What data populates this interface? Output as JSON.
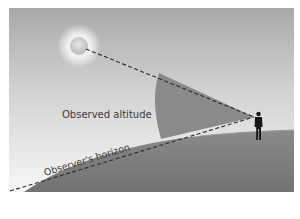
{
  "diagram": {
    "labels": {
      "observed_altitude": "Observed altitude",
      "observers_horizon": "Observer's horizon"
    },
    "elements": {
      "sun": "sun-icon",
      "observer": "person-silhouette-icon",
      "earth": "earth-surface",
      "sightline": "dashed line from observer to sun",
      "horizon_line": "dashed line tangent to observer's horizon",
      "angle": "shaded wedge between horizon and sightline"
    },
    "colors": {
      "sky_top": "#a9a9a9",
      "sky_bottom": "#f6f6f6",
      "earth": "#7c7c7c",
      "earth_top": "#8e8e8e",
      "wedge": "#8a8a8a",
      "observer": "#151515",
      "dash": "#2a2a2a",
      "sun": "#c8c8c8",
      "label": "#3a3a3a"
    }
  }
}
